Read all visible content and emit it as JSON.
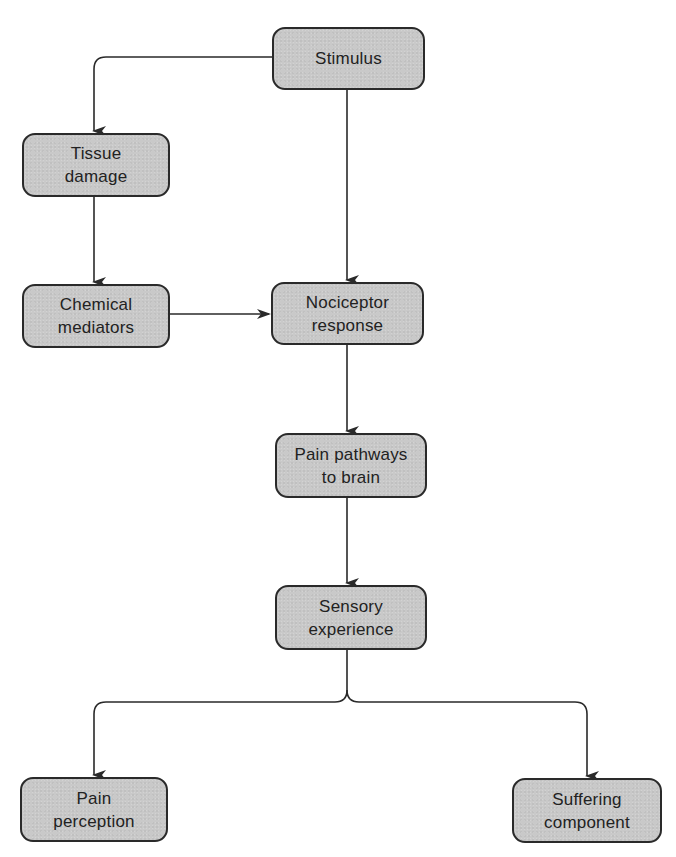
{
  "diagram": {
    "type": "flowchart",
    "colors": {
      "node_fill": "#c9c9c9",
      "node_border": "#2a2a2a",
      "text": "#222222",
      "connector": "#2a2a2a",
      "background": "#ffffff"
    },
    "nodes": {
      "stimulus": {
        "line1": "Stimulus",
        "line2": ""
      },
      "tissue_damage": {
        "line1": "Tissue",
        "line2": "damage"
      },
      "chemical_mediators": {
        "line1": "Chemical",
        "line2": "mediators"
      },
      "nociceptor_response": {
        "line1": "Nociceptor",
        "line2": "response"
      },
      "pain_pathways": {
        "line1": "Pain pathways",
        "line2": "to brain"
      },
      "sensory_experience": {
        "line1": "Sensory",
        "line2": "experience"
      },
      "pain_perception": {
        "line1": "Pain",
        "line2": "perception"
      },
      "suffering_component": {
        "line1": "Suffering",
        "line2": "component"
      }
    },
    "edges": [
      {
        "from": "Stimulus",
        "to": "Tissue damage"
      },
      {
        "from": "Stimulus",
        "to": "Nociceptor response"
      },
      {
        "from": "Tissue damage",
        "to": "Chemical mediators"
      },
      {
        "from": "Chemical mediators",
        "to": "Nociceptor response"
      },
      {
        "from": "Nociceptor response",
        "to": "Pain pathways to brain"
      },
      {
        "from": "Pain pathways to brain",
        "to": "Sensory experience"
      },
      {
        "from": "Sensory experience",
        "to": "Pain perception"
      },
      {
        "from": "Sensory experience",
        "to": "Suffering component"
      }
    ]
  }
}
